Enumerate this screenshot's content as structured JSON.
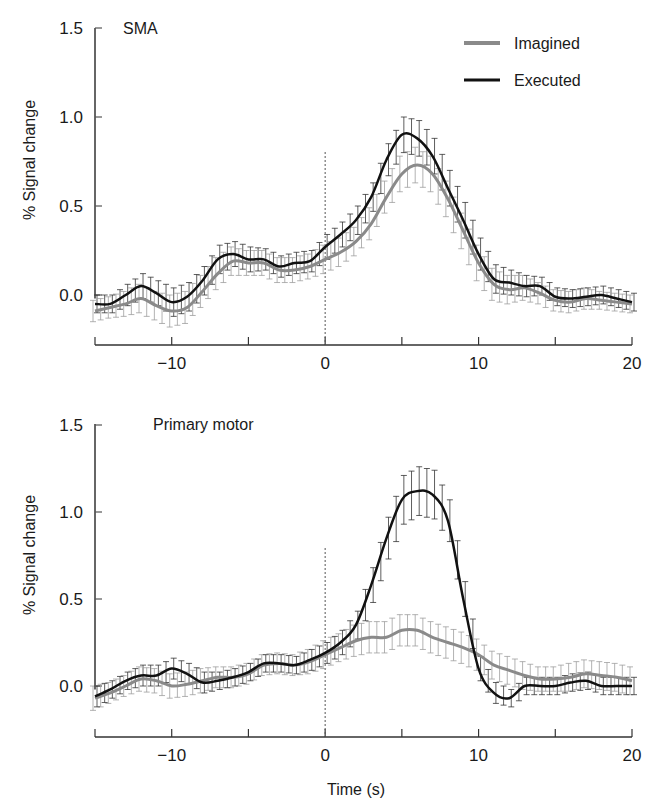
{
  "chart_data": [
    {
      "type": "line",
      "title": "SMA",
      "xlabel": "",
      "ylabel": "% Signal change",
      "xlim": [
        -15,
        20
      ],
      "ylim": [
        -0.25,
        1.5
      ],
      "xticks": [
        -15,
        -10,
        -5,
        0,
        5,
        10,
        15,
        20
      ],
      "xtick_labels": [
        "",
        "−10",
        "",
        "0",
        "",
        "10",
        "",
        "20"
      ],
      "yticks": [
        0.0,
        0.5,
        1.0,
        1.5
      ],
      "ytick_labels": [
        "0.0",
        "0.5",
        "1.0",
        "1.5"
      ],
      "grid": false,
      "legend_position": "upper right",
      "vline_x": 0,
      "x": [
        -15,
        -14,
        -13,
        -12,
        -11,
        -10,
        -9,
        -8,
        -7,
        -6,
        -5,
        -4,
        -3,
        -2,
        -1,
        0,
        1,
        2,
        3,
        4,
        5,
        6,
        7,
        8,
        9,
        10,
        11,
        12,
        13,
        14,
        15,
        16,
        17,
        18,
        19,
        20
      ],
      "series": [
        {
          "name": "Imagined",
          "color": "#8a8a8a",
          "values": [
            -0.09,
            -0.07,
            -0.05,
            -0.02,
            -0.06,
            -0.09,
            -0.07,
            0.02,
            0.12,
            0.19,
            0.18,
            0.18,
            0.14,
            0.14,
            0.16,
            0.2,
            0.24,
            0.3,
            0.4,
            0.55,
            0.68,
            0.73,
            0.68,
            0.54,
            0.36,
            0.18,
            0.06,
            0.03,
            0.04,
            0.01,
            -0.03,
            -0.04,
            -0.02,
            -0.03,
            -0.04,
            -0.05
          ],
          "error": [
            0.06,
            0.06,
            0.07,
            0.08,
            0.08,
            0.09,
            0.09,
            0.09,
            0.09,
            0.08,
            0.07,
            0.07,
            0.07,
            0.07,
            0.07,
            0.08,
            0.08,
            0.08,
            0.09,
            0.09,
            0.1,
            0.1,
            0.1,
            0.1,
            0.1,
            0.1,
            0.09,
            0.08,
            0.07,
            0.06,
            0.06,
            0.06,
            0.06,
            0.05,
            0.05,
            0.05
          ]
        },
        {
          "name": "Executed",
          "color": "#111111",
          "values": [
            -0.05,
            -0.05,
            0.0,
            0.05,
            0.01,
            -0.04,
            -0.01,
            0.08,
            0.2,
            0.23,
            0.2,
            0.2,
            0.16,
            0.18,
            0.19,
            0.27,
            0.34,
            0.42,
            0.55,
            0.76,
            0.9,
            0.88,
            0.78,
            0.6,
            0.42,
            0.23,
            0.09,
            0.07,
            0.05,
            0.05,
            -0.01,
            -0.02,
            -0.01,
            0.0,
            -0.02,
            -0.04
          ],
          "error": [
            0.05,
            0.05,
            0.06,
            0.07,
            0.07,
            0.08,
            0.08,
            0.08,
            0.08,
            0.07,
            0.07,
            0.06,
            0.06,
            0.06,
            0.06,
            0.07,
            0.07,
            0.08,
            0.08,
            0.09,
            0.1,
            0.1,
            0.1,
            0.1,
            0.1,
            0.09,
            0.08,
            0.07,
            0.06,
            0.05,
            0.05,
            0.05,
            0.05,
            0.05,
            0.05,
            0.05
          ]
        }
      ]
    },
    {
      "type": "line",
      "title": "Primary motor",
      "xlabel": "Time (s)",
      "ylabel": "% Signal change",
      "xlim": [
        -15,
        20
      ],
      "ylim": [
        -0.25,
        1.5
      ],
      "xticks": [
        -15,
        -10,
        -5,
        0,
        5,
        10,
        15,
        20
      ],
      "xtick_labels": [
        "",
        "−10",
        "",
        "0",
        "",
        "10",
        "",
        "20"
      ],
      "yticks": [
        0.0,
        0.5,
        1.0,
        1.5
      ],
      "ytick_labels": [
        "0.0",
        "0.5",
        "1.0",
        "1.5"
      ],
      "grid": false,
      "vline_x": 0,
      "x": [
        -15,
        -14,
        -13,
        -12,
        -11,
        -10,
        -9,
        -8,
        -7,
        -6,
        -5,
        -4,
        -3,
        -2,
        -1,
        0,
        1,
        2,
        3,
        4,
        5,
        6,
        7,
        8,
        9,
        10,
        11,
        12,
        13,
        14,
        15,
        16,
        17,
        18,
        19,
        20
      ],
      "series": [
        {
          "name": "Imagined",
          "color": "#8a8a8a",
          "values": [
            -0.07,
            -0.04,
            0.0,
            0.04,
            0.03,
            0.0,
            0.01,
            0.03,
            0.05,
            0.05,
            0.07,
            0.12,
            0.13,
            0.12,
            0.14,
            0.18,
            0.22,
            0.26,
            0.28,
            0.28,
            0.32,
            0.32,
            0.28,
            0.25,
            0.22,
            0.18,
            0.12,
            0.09,
            0.06,
            0.04,
            0.04,
            0.05,
            0.07,
            0.06,
            0.05,
            0.03
          ],
          "error": [
            0.07,
            0.06,
            0.06,
            0.07,
            0.07,
            0.07,
            0.07,
            0.07,
            0.06,
            0.06,
            0.06,
            0.06,
            0.06,
            0.06,
            0.07,
            0.08,
            0.08,
            0.09,
            0.09,
            0.09,
            0.09,
            0.09,
            0.09,
            0.09,
            0.09,
            0.09,
            0.08,
            0.08,
            0.08,
            0.07,
            0.07,
            0.08,
            0.08,
            0.08,
            0.08,
            0.08
          ]
        },
        {
          "name": "Executed",
          "color": "#111111",
          "values": [
            -0.06,
            -0.02,
            0.03,
            0.06,
            0.06,
            0.1,
            0.07,
            0.02,
            0.03,
            0.05,
            0.08,
            0.13,
            0.13,
            0.12,
            0.15,
            0.19,
            0.25,
            0.35,
            0.58,
            0.85,
            1.07,
            1.12,
            1.1,
            0.95,
            0.5,
            0.1,
            -0.04,
            -0.07,
            0.0,
            0.0,
            0.0,
            0.02,
            0.03,
            0.0,
            0.0,
            0.0
          ],
          "error": [
            0.06,
            0.05,
            0.05,
            0.06,
            0.06,
            0.06,
            0.06,
            0.06,
            0.05,
            0.05,
            0.05,
            0.05,
            0.05,
            0.05,
            0.06,
            0.06,
            0.07,
            0.08,
            0.1,
            0.12,
            0.14,
            0.14,
            0.14,
            0.12,
            0.1,
            0.07,
            0.06,
            0.05,
            0.05,
            0.05,
            0.05,
            0.05,
            0.05,
            0.05,
            0.05,
            0.05
          ]
        }
      ]
    }
  ],
  "panels": {
    "top": {
      "title": "SMA",
      "ylabel": "% Signal change"
    },
    "bottom": {
      "title": "Primary motor",
      "ylabel": "% Signal change",
      "xlabel": "Time (s)"
    }
  },
  "legend": {
    "items": [
      {
        "label": "Imagined",
        "color": "#8a8a8a"
      },
      {
        "label": "Executed",
        "color": "#111111"
      }
    ]
  }
}
